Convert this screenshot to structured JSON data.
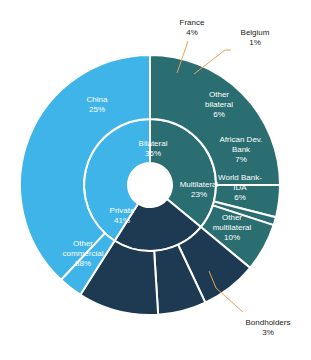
{
  "chart_data": {
    "type": "pie",
    "title": "",
    "subtitle": "",
    "xlabel": "",
    "ylabel": "",
    "legend_position": "none",
    "grid": false,
    "variant": "nested-donut-sunburst",
    "start_angle_deg": 0,
    "direction": "clockwise",
    "units": "percent",
    "geometry": {
      "center_x": 150,
      "center_y": 185,
      "inner_radius": 22,
      "ring_boundary_radius": 66,
      "outer_radius": 130,
      "separator_color": "#ffffff",
      "separator_width": 2
    },
    "colors": {
      "bilateral": "#2a6e71",
      "multilateral": "#1e3a52",
      "private": "#3fb4e8",
      "leader_line": "#e8a05c",
      "background": "#ffffff",
      "label_light": "#ffffff",
      "label_dark": "#1a1a1a"
    },
    "inner_ring": {
      "name": "Creditor category",
      "categories": [
        "Bilateral",
        "Multilateral",
        "Private"
      ],
      "values": [
        36,
        23,
        41
      ],
      "labels": [
        "Bilateral\n36%",
        "Multilateral\n23%",
        "Private\n41%"
      ],
      "slices": [
        {
          "label": "Bilateral",
          "value": 36,
          "value_text": "36%",
          "color": "#2a6e71",
          "label_x": 153,
          "label_y": 149,
          "label_fill": "light"
        },
        {
          "label": "Multilateral",
          "value": 23,
          "value_text": "23%",
          "color": "#1e3a52",
          "label_x": 199,
          "label_y": 190,
          "label_fill": "light"
        },
        {
          "label": "Private",
          "value": 41,
          "value_text": "41%",
          "color": "#3fb4e8",
          "label_x": 122,
          "label_y": 216,
          "label_fill": "light"
        }
      ]
    },
    "outer_ring": {
      "name": "Creditor",
      "categories": [
        "China",
        "France",
        "Belgium",
        "Other bilateral",
        "African Dev. Bank",
        "World Bank-IDA",
        "Other multilateral",
        "Bondholders",
        "Other commercial"
      ],
      "values": [
        25,
        4,
        1,
        6,
        7,
        6,
        10,
        3,
        38
      ],
      "slices": [
        {
          "label": "China",
          "value": 25,
          "value_text": "25%",
          "color": "#2a6e71",
          "parent": "Bilateral",
          "placement": "inside",
          "label_x": 97,
          "label_y": 105,
          "label_fill": "light"
        },
        {
          "label": "France",
          "value": 4,
          "value_text": "4%",
          "color": "#2a6e71",
          "parent": "Bilateral",
          "placement": "callout",
          "label_x": 192,
          "label_y": 30,
          "label_fill": "dark"
        },
        {
          "label": "Belgium",
          "value": 1,
          "value_text": "1%",
          "color": "#2a6e71",
          "parent": "Bilateral",
          "placement": "callout",
          "label_x": 255,
          "label_y": 40,
          "label_fill": "dark"
        },
        {
          "label": "Other bilateral",
          "value": 6,
          "value_text": "6%",
          "color": "#2a6e71",
          "parent": "Bilateral",
          "placement": "inside",
          "label_x": 219,
          "label_y": 105,
          "label_fill": "light"
        },
        {
          "label": "African Dev. Bank",
          "value": 7,
          "value_text": "7%",
          "color": "#1e3a52",
          "parent": "Multilateral",
          "placement": "inside",
          "label_x": 241,
          "label_y": 150,
          "label_fill": "light"
        },
        {
          "label": "World Bank-IDA",
          "value": 6,
          "value_text": "6%",
          "color": "#1e3a52",
          "parent": "Multilateral",
          "placement": "inside",
          "label_x": 240,
          "label_y": 188,
          "label_fill": "light"
        },
        {
          "label": "Other multilateral",
          "value": 10,
          "value_text": "10%",
          "color": "#1e3a52",
          "parent": "Multilateral",
          "placement": "inside",
          "label_x": 232,
          "label_y": 228,
          "label_fill": "light"
        },
        {
          "label": "Bondholders",
          "value": 3,
          "value_text": "3%",
          "color": "#3fb4e8",
          "parent": "Private",
          "placement": "callout",
          "label_x": 268,
          "label_y": 330,
          "label_fill": "dark"
        },
        {
          "label": "Other commercial",
          "value": 38,
          "value_text": "38%",
          "color": "#3fb4e8",
          "parent": "Private",
          "placement": "inside",
          "label_x": 83,
          "label_y": 254,
          "label_fill": "light"
        }
      ]
    },
    "callouts": [
      {
        "name": "france",
        "from_x": 188,
        "from_y": 41,
        "to_x": 177,
        "to_y": 73,
        "bend_x": 186,
        "bend_y": 47
      },
      {
        "name": "belgium",
        "from_x": 231,
        "from_y": 50,
        "to_x": 194,
        "to_y": 74,
        "bend_x": 225,
        "bend_y": 50
      },
      {
        "name": "bondholders",
        "from_x": 243,
        "from_y": 312,
        "to_x": 209,
        "to_y": 271,
        "bend_x": 216,
        "bend_y": 288
      }
    ]
  },
  "top_strip": {
    "text": ""
  }
}
